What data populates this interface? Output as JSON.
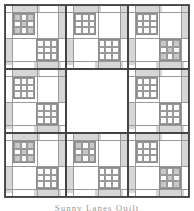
{
  "figure": {
    "type": "quilt-layout-diagram",
    "grid": {
      "rows": 3,
      "cols": 3
    },
    "colors": {
      "border": "#444444",
      "strip": "#d6d6d6",
      "line": "#9a9a9a",
      "dark_square": "#c8c8c8",
      "light_square": "#e2e2e2",
      "background": "#ffffff"
    },
    "blocks": [
      {
        "id": "r1c1",
        "row": 1,
        "col": 1,
        "top_left_patch": "x-pattern",
        "bottom_right_patch": "plain-grid"
      },
      {
        "id": "r1c2",
        "row": 1,
        "col": 2,
        "top_left_patch": "plain-grid",
        "bottom_right_patch": "plain-grid"
      },
      {
        "id": "r1c3",
        "row": 1,
        "col": 3,
        "top_left_patch": "plain-grid",
        "bottom_right_patch": "x-pattern"
      },
      {
        "id": "r2c1",
        "row": 2,
        "col": 1,
        "top_left_patch": "plain-grid",
        "bottom_right_patch": "plain-grid"
      },
      {
        "id": "r2c2",
        "row": 2,
        "col": 2,
        "top_left_patch": "none",
        "bottom_right_patch": "none",
        "blank": true
      },
      {
        "id": "r2c3",
        "row": 2,
        "col": 3,
        "top_left_patch": "plain-grid",
        "bottom_right_patch": "plain-grid"
      },
      {
        "id": "r3c1",
        "row": 3,
        "col": 1,
        "top_left_patch": "x-pattern",
        "bottom_right_patch": "plain-grid"
      },
      {
        "id": "r3c2",
        "row": 3,
        "col": 2,
        "top_left_patch": "x-pattern",
        "bottom_right_patch": "plain-grid"
      },
      {
        "id": "r3c3",
        "row": 3,
        "col": 3,
        "top_left_patch": "plain-grid",
        "bottom_right_patch": "x-pattern"
      }
    ]
  },
  "caption": {
    "text": "Sunny Lanes Quilt"
  }
}
